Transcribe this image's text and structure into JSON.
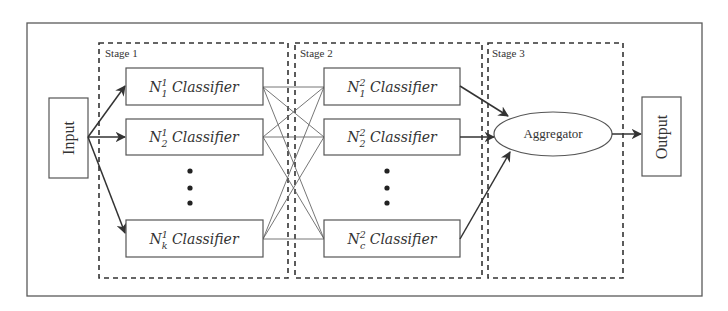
{
  "diagram": {
    "type": "multi-stage classifier pipeline",
    "input": {
      "label": "Input"
    },
    "output": {
      "label": "Output"
    },
    "stages": [
      {
        "label": "Stage 1",
        "classifiers": [
          {
            "base": "N",
            "sup": "1",
            "sub": "1",
            "suffix": " Classifier"
          },
          {
            "base": "N",
            "sup": "1",
            "sub": "2",
            "suffix": " Classifier"
          },
          {
            "base": "N",
            "sup": "1",
            "sub": "k",
            "suffix": " Classifier"
          }
        ],
        "ellipsis": "⋮"
      },
      {
        "label": "Stage 2",
        "classifiers": [
          {
            "base": "N",
            "sup": "2",
            "sub": "1",
            "suffix": " Classifier"
          },
          {
            "base": "N",
            "sup": "2",
            "sub": "2",
            "suffix": " Classifier"
          },
          {
            "base": "N",
            "sup": "2",
            "sub": "c",
            "suffix": " Classifier"
          }
        ],
        "ellipsis": "⋮"
      },
      {
        "label": "Stage 3",
        "aggregator": {
          "label": "Aggregator"
        }
      }
    ],
    "edges": [
      "Input -> N^1_1",
      "Input -> N^1_2",
      "Input -> N^1_k",
      "N^1_* -> N^2_* (fully connected)",
      "N^2_1 -> Aggregator",
      "N^2_2 -> Aggregator",
      "N^2_c -> Aggregator",
      "Aggregator -> Output"
    ],
    "colors": {
      "stroke": "#333333",
      "frame": "#5a5a5a",
      "background": "#ffffff"
    }
  }
}
